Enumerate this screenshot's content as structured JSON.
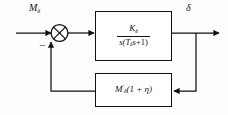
{
  "diagram": {
    "type": "control-system-block-diagram",
    "canvas": {
      "width": 228,
      "height": 115
    },
    "colors": {
      "background": "#fdfdfd",
      "line": "#111111",
      "block_fill": "#ffffff",
      "block_border": "#111111"
    },
    "labels": {
      "input": {
        "base": "M",
        "subscript": "δ"
      },
      "output": {
        "base": "δ"
      },
      "minus_sign": "−"
    },
    "summing_junction": {
      "name": "summing-junction",
      "style": "circle-with-cross",
      "inputs": [
        {
          "from": "input-signal",
          "direction": "left",
          "sign": "+"
        },
        {
          "from": "feedback-signal",
          "direction": "bottom",
          "sign": "−"
        }
      ],
      "output_direction": "right"
    },
    "blocks": [
      {
        "id": "forward-block",
        "role": "forward-path-transfer-function",
        "numerator": {
          "base": "K",
          "subscript": "δ"
        },
        "denominator": {
          "text": "s(Tδs+1)",
          "parts": [
            "s(",
            "T",
            "δ",
            "s",
            "+1)"
          ]
        }
      },
      {
        "id": "feedback-block",
        "role": "feedback-path-gain",
        "expression": {
          "base": "M",
          "prime": "′",
          "subscript": "δ",
          "factor": "(1 + η)"
        }
      }
    ],
    "signal_paths": [
      {
        "name": "input-signal",
        "from": "left-edge",
        "to": "summing-junction",
        "arrowhead": true
      },
      {
        "name": "error-signal",
        "from": "summing-junction",
        "to": "forward-block",
        "arrowhead": true
      },
      {
        "name": "output-signal",
        "from": "forward-block",
        "to": "right-edge",
        "arrowhead": true
      },
      {
        "name": "feedback-tap",
        "from": "output-signal",
        "to": "feedback-block-right",
        "arrowhead": true
      },
      {
        "name": "feedback-return",
        "from": "feedback-block-left",
        "to": "summing-junction",
        "arrowhead": true
      }
    ]
  }
}
